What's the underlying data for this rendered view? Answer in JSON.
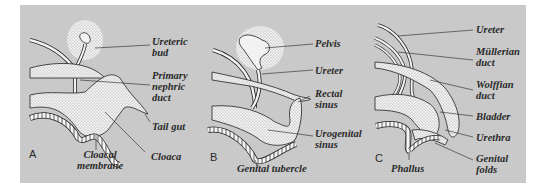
{
  "figure": {
    "background_color": "#c9c9c9",
    "panels": [
      {
        "letter": "A",
        "labels": [
          {
            "id": "ureteric-bud",
            "l1": "Ureteric",
            "l2": "bud"
          },
          {
            "id": "primary-nephric-duct",
            "l1": "Primary",
            "l2": "nephric",
            "l3": "duct"
          },
          {
            "id": "tail-gut",
            "l1": "Tail gut"
          },
          {
            "id": "cloaca",
            "l1": "Cloaca"
          },
          {
            "id": "cloacal-membrane",
            "l1": "Cloacal",
            "l2": "membrane"
          }
        ]
      },
      {
        "letter": "B",
        "labels": [
          {
            "id": "pelvis",
            "l1": "Pelvis"
          },
          {
            "id": "ureter",
            "l1": "Ureter"
          },
          {
            "id": "rectal-sinus",
            "l1": "Rectal",
            "l2": "sinus"
          },
          {
            "id": "urogenital-sinus",
            "l1": "Urogenital",
            "l2": "sinus"
          },
          {
            "id": "genital-tubercle",
            "l1": "Genital tubercle"
          }
        ]
      },
      {
        "letter": "C",
        "labels": [
          {
            "id": "ureter",
            "l1": "Ureter"
          },
          {
            "id": "mullerian-duct",
            "l1": "Müllerian",
            "l2": "duct"
          },
          {
            "id": "wolffian-duct",
            "l1": "Wolffian",
            "l2": "duct"
          },
          {
            "id": "bladder",
            "l1": "Bladder"
          },
          {
            "id": "urethra",
            "l1": "Urethra"
          },
          {
            "id": "genital-folds",
            "l1": "Genital",
            "l2": "folds"
          },
          {
            "id": "phallus",
            "l1": "Phallus"
          }
        ]
      }
    ]
  }
}
